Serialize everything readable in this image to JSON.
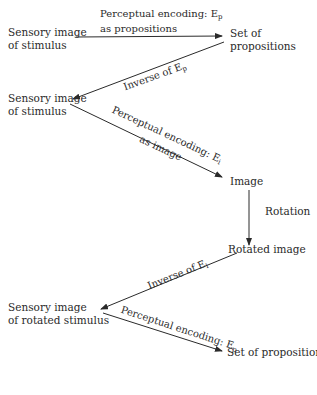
{
  "nodes": {
    "sensory_1": [
      "Sensory image",
      "of stimulus"
    ],
    "set_props_1": [
      "Set of",
      "propositions"
    ],
    "sensory_2": [
      "Sensory image",
      "of stimulus"
    ],
    "image": "Image",
    "rotated_image": "Rotated image",
    "sensory_3": [
      "Sensory image",
      "of rotated stimulus"
    ],
    "set_props_2": "Set of propositions"
  },
  "edges": {
    "encode_props_1": {
      "line1": "Perceptual encoding: E",
      "sub": "p",
      "line2": "as propositions"
    },
    "inverse_ep": {
      "text": "Inverse of E",
      "sub": "p"
    },
    "encode_image": {
      "line1": "Perceptual encoding: E",
      "sub": "i",
      "line2": "as image"
    },
    "rotation": {
      "text": "Rotation"
    },
    "inverse_ei": {
      "text": "Inverse of E",
      "sub": "i"
    },
    "encode_props_2": {
      "line1": "Perceptual encoding: E",
      "sub": "p"
    }
  },
  "colors": {
    "ink": "#2a2a2a",
    "background": "#ffffff"
  }
}
